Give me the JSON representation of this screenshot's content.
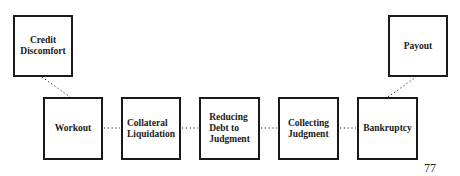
{
  "diagram": {
    "type": "process-flow",
    "top_nodes": [
      {
        "id": "credit-discomfort",
        "label": "Credit\nDiscomfort"
      },
      {
        "id": "payout",
        "label": "Payout"
      }
    ],
    "main_nodes": [
      {
        "id": "workout",
        "label": "Workout"
      },
      {
        "id": "collateral-liquidation",
        "label": "Collateral\nLiquidation"
      },
      {
        "id": "reducing-debt",
        "label": "Reducing\nDebt to\nJudgment"
      },
      {
        "id": "collecting-judgment",
        "label": "Collecting\nJudgment"
      },
      {
        "id": "bankruptcy",
        "label": "Bankruptcy"
      }
    ],
    "edges": [
      {
        "from": "credit-discomfort",
        "to": "workout",
        "style": "dotted"
      },
      {
        "from": "workout",
        "to": "collateral-liquidation",
        "style": "dotted"
      },
      {
        "from": "collateral-liquidation",
        "to": "reducing-debt",
        "style": "dotted"
      },
      {
        "from": "reducing-debt",
        "to": "collecting-judgment",
        "style": "dotted"
      },
      {
        "from": "collecting-judgment",
        "to": "bankruptcy",
        "style": "dotted"
      },
      {
        "from": "bankruptcy",
        "to": "payout",
        "style": "dotted"
      }
    ]
  },
  "page": {
    "number": "77"
  },
  "colors": {
    "line": "#1a1a1a",
    "background": "#ffffff"
  }
}
